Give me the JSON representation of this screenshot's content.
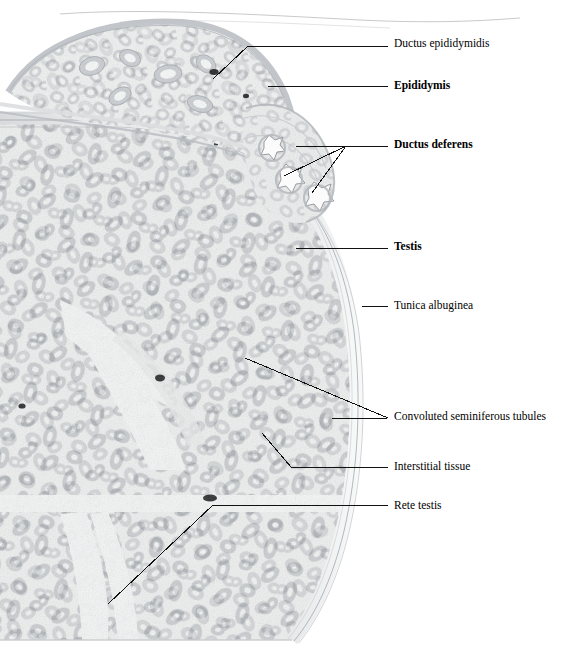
{
  "figure": {
    "kind": "histology-micrograph",
    "specimen": "testis and epididymis cross-section",
    "stain_tone": "grayscale",
    "background_color": "#ffffff",
    "tissue_tone": "#b9bcc0",
    "leader_color": "#111111"
  },
  "labels": [
    {
      "id": "ductus-epididymidis",
      "text": "Ductus epididymidis",
      "bold": false,
      "x": 394,
      "y": 38
    },
    {
      "id": "epididymis",
      "text": "Epididymis",
      "bold": true,
      "x": 394,
      "y": 80
    },
    {
      "id": "ductus-deferens",
      "text": "Ductus deferens",
      "bold": true,
      "x": 394,
      "y": 139
    },
    {
      "id": "testis",
      "text": "Testis",
      "bold": true,
      "x": 394,
      "y": 241
    },
    {
      "id": "tunica-albuginea",
      "text": "Tunica albuginea",
      "bold": false,
      "x": 394,
      "y": 300
    },
    {
      "id": "convoluted-seminiferous-tubules",
      "text": "Convoluted seminiferous tubules",
      "bold": false,
      "x": 394,
      "y": 411
    },
    {
      "id": "interstitial-tissue",
      "text": "Interstitial tissue",
      "bold": false,
      "x": 394,
      "y": 461
    },
    {
      "id": "rete-testis",
      "text": "Rete testis",
      "bold": false,
      "x": 394,
      "y": 500
    }
  ],
  "leaders": [
    {
      "for": "ductus-epididymidis",
      "points": [
        [
          388,
          46
        ],
        [
          248,
          46
        ],
        [
          213,
          79
        ]
      ]
    },
    {
      "for": "epididymis",
      "points": [
        [
          388,
          86
        ],
        [
          268,
          86
        ]
      ]
    },
    {
      "for": "ductus-deferens",
      "points": [
        [
          388,
          146
        ],
        [
          296,
          146
        ]
      ]
    },
    {
      "for": "ductus-deferens",
      "points": [
        [
          346,
          146
        ],
        [
          284,
          176
        ]
      ]
    },
    {
      "for": "ductus-deferens",
      "points": [
        [
          346,
          146
        ],
        [
          312,
          193
        ]
      ]
    },
    {
      "for": "testis",
      "points": [
        [
          388,
          248
        ],
        [
          296,
          248
        ]
      ]
    },
    {
      "for": "tunica-albuginea",
      "points": [
        [
          388,
          306
        ],
        [
          362,
          306
        ]
      ]
    },
    {
      "for": "convoluted-seminiferous-tubules",
      "points": [
        [
          388,
          418
        ],
        [
          245,
          358
        ]
      ]
    },
    {
      "for": "convoluted-seminiferous-tubules",
      "points": [
        [
          388,
          418
        ],
        [
          332,
          419
        ]
      ]
    },
    {
      "for": "interstitial-tissue",
      "points": [
        [
          388,
          467
        ],
        [
          291,
          467
        ],
        [
          262,
          433
        ]
      ]
    },
    {
      "for": "rete-testis",
      "points": [
        [
          388,
          505
        ],
        [
          213,
          505
        ],
        [
          108,
          604
        ]
      ]
    }
  ]
}
